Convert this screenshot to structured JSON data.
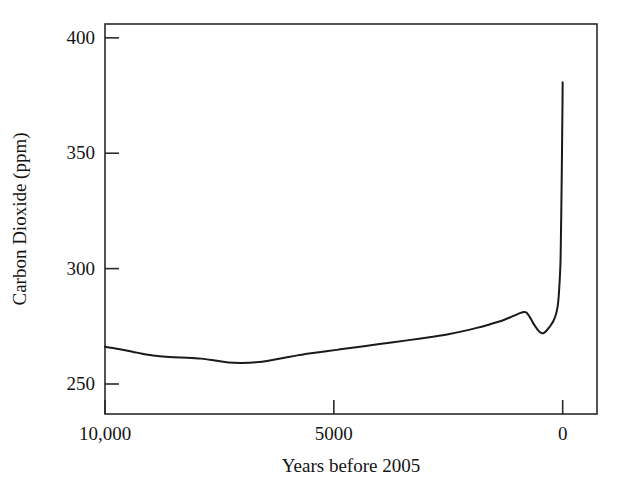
{
  "chart_data": {
    "type": "line",
    "title": "",
    "xlabel": "Years before 2005",
    "ylabel": "Carbon Dioxide (ppm)",
    "xlim": [
      10000,
      -750
    ],
    "ylim": [
      237,
      406
    ],
    "x_inverted": true,
    "grid": false,
    "legend": null,
    "xticks": [
      {
        "value": 10000,
        "label": "10,000"
      },
      {
        "value": 5000,
        "label": "5000"
      },
      {
        "value": 0,
        "label": "0"
      }
    ],
    "yticks": [
      {
        "value": 400,
        "label": "400"
      },
      {
        "value": 350,
        "label": "350"
      },
      {
        "value": 300,
        "label": "300"
      },
      {
        "value": 250,
        "label": "250"
      }
    ],
    "line_color": "#1a1a1a",
    "line_width": 2.0,
    "series": [
      {
        "name": "Atmospheric CO2",
        "x": [
          10000,
          9700,
          9400,
          9100,
          8800,
          8500,
          8200,
          7900,
          7600,
          7300,
          7000,
          6700,
          6400,
          6100,
          5800,
          5500,
          5200,
          4900,
          4600,
          4300,
          4000,
          3700,
          3400,
          3100,
          2800,
          2500,
          2200,
          1900,
          1600,
          1300,
          1100,
          950,
          850,
          800,
          750,
          700,
          650,
          600,
          550,
          500,
          450,
          400,
          350,
          300,
          250,
          200,
          150,
          120,
          100,
          80,
          60,
          45,
          30,
          15,
          5,
          0
        ],
        "y": [
          266.1,
          265.2,
          264.0,
          262.8,
          262.0,
          261.6,
          261.4,
          261.0,
          260.2,
          259.3,
          259.1,
          259.4,
          260.2,
          261.3,
          262.4,
          263.3,
          264.1,
          264.9,
          265.7,
          266.5,
          267.3,
          268.1,
          268.9,
          269.7,
          270.6,
          271.6,
          272.8,
          274.2,
          275.8,
          277.6,
          279.3,
          280.6,
          281.2,
          281.0,
          280.0,
          278.4,
          276.6,
          275.0,
          273.6,
          272.5,
          272.0,
          272.3,
          273.2,
          274.4,
          275.8,
          277.4,
          280.0,
          282.5,
          285.0,
          290.0,
          297.0,
          305.0,
          325.0,
          350.0,
          370.0,
          380.8
        ]
      }
    ]
  },
  "axes": {
    "frame": {
      "left": 105,
      "right": 597,
      "top": 24,
      "bottom": 414
    },
    "tick_inward_length": 14,
    "frame_color": "#2a2a2a"
  }
}
